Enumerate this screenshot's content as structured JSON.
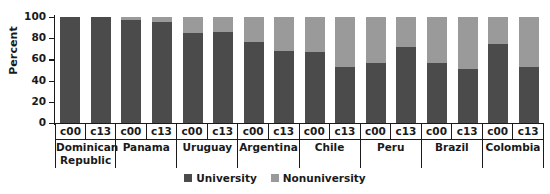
{
  "chart_data": {
    "type": "bar",
    "subtype": "stacked-bar-100",
    "title": "",
    "xlabel": "",
    "ylabel": "Percent",
    "ylim": [
      0,
      100
    ],
    "yticks": [
      0,
      20,
      40,
      60,
      80,
      100
    ],
    "grid": false,
    "legend_position": "bottom-center",
    "categories": [
      "Dominican Republic c00",
      "Dominican Republic c13",
      "Panama c00",
      "Panama c13",
      "Uruguay c00",
      "Uruguay c13",
      "Argentina c00",
      "Argentina c13",
      "Chile c00",
      "Chile c13",
      "Peru c00",
      "Peru c13",
      "Brazil c00",
      "Brazil c13",
      "Colombia c00",
      "Colombia c13"
    ],
    "groups": [
      {
        "country": "Dominican Republic",
        "periods": [
          "c00",
          "c13"
        ],
        "university": [
          100,
          100
        ],
        "nonuniversity": [
          0,
          0
        ]
      },
      {
        "country": "Panama",
        "periods": [
          "c00",
          "c13"
        ],
        "university": [
          97,
          95
        ],
        "nonuniversity": [
          3,
          5
        ]
      },
      {
        "country": "Uruguay",
        "periods": [
          "c00",
          "c13"
        ],
        "university": [
          85,
          86
        ],
        "nonuniversity": [
          15,
          14
        ]
      },
      {
        "country": "Argentina",
        "periods": [
          "c00",
          "c13"
        ],
        "university": [
          76,
          68
        ],
        "nonuniversity": [
          24,
          32
        ]
      },
      {
        "country": "Chile",
        "periods": [
          "c00",
          "c13"
        ],
        "university": [
          67,
          53
        ],
        "nonuniversity": [
          33,
          47
        ]
      },
      {
        "country": "Peru",
        "periods": [
          "c00",
          "c13"
        ],
        "university": [
          57,
          72
        ],
        "nonuniversity": [
          43,
          28
        ]
      },
      {
        "country": "Brazil",
        "periods": [
          "c00",
          "c13"
        ],
        "university": [
          57,
          51
        ],
        "nonuniversity": [
          43,
          49
        ]
      },
      {
        "country": "Colombia",
        "periods": [
          "c00",
          "c13"
        ],
        "university": [
          75,
          53
        ],
        "nonuniversity": [
          25,
          47
        ]
      }
    ],
    "series": [
      {
        "name": "University",
        "color": "#4b4b4b",
        "values": [
          100,
          100,
          97,
          95,
          85,
          86,
          76,
          68,
          67,
          53,
          57,
          72,
          57,
          51,
          75,
          53
        ]
      },
      {
        "name": "Nonuniversity",
        "color": "#9a9a9a",
        "values": [
          0,
          0,
          3,
          5,
          15,
          14,
          24,
          32,
          33,
          47,
          43,
          28,
          43,
          49,
          25,
          47
        ]
      }
    ],
    "legend": [
      {
        "label": "University",
        "color": "#4b4b4b",
        "swatch": "legend-swatch-university"
      },
      {
        "label": "Nonuniversity",
        "color": "#9a9a9a",
        "swatch": "legend-swatch-nonuniversity"
      }
    ]
  },
  "colors": {
    "university": "#4b4b4b",
    "nonuniversity": "#9a9a9a",
    "axis": "#1a1a1a",
    "background": "#ffffff"
  }
}
